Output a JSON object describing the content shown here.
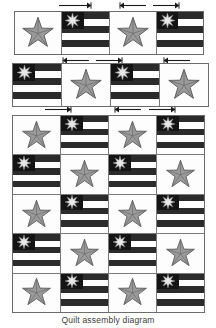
{
  "caption": "Quilt assembly diagram",
  "colors": {
    "stripe_dark": "#2b2b2b",
    "stripe_light": "#ffffff",
    "canton": "#141414",
    "star_fill": "#9a9a9a",
    "star_outline": "#5a5a5a",
    "canton_star_fill": "#e8e8e8",
    "block_border": "#6b6b6b",
    "background": "#ffffff",
    "caption_color": "#3a3a3a",
    "arrow_color": "#1a1a1a"
  },
  "arrow_rows": [
    {
      "name": "arrow-row-top",
      "arrows": [
        {
          "direction": "right",
          "left": 58,
          "width": 34
        },
        {
          "direction": "left",
          "left": 119,
          "width": 28
        },
        {
          "direction": "right",
          "left": 152,
          "width": 28
        }
      ]
    },
    {
      "name": "arrow-row-between-strip1-strip2",
      "arrows": [
        {
          "direction": "left",
          "left": 62,
          "width": 28
        },
        {
          "direction": "right",
          "left": 95,
          "width": 28
        },
        {
          "direction": "left",
          "left": 163,
          "width": 28
        }
      ]
    },
    {
      "name": "arrow-row-between-strip2-body",
      "arrows": [
        {
          "direction": "right",
          "left": 44,
          "width": 28
        },
        {
          "direction": "left",
          "left": 114,
          "width": 28
        },
        {
          "direction": "right",
          "left": 148,
          "width": 28
        }
      ]
    }
  ],
  "strips": [
    {
      "name": "block-strip-row-1",
      "top": 11,
      "left": 14,
      "width": 190,
      "height": 44,
      "cells": [
        {
          "type": "star",
          "star": "five-point"
        },
        {
          "type": "flag",
          "star": "eight-point",
          "stripe_pattern": [
            "d",
            "l",
            "d",
            "l",
            "d",
            "l"
          ]
        },
        {
          "type": "star",
          "star": "five-point"
        },
        {
          "type": "flag",
          "star": "eight-point",
          "stripe_pattern": [
            "d",
            "l",
            "d",
            "l",
            "d",
            "l"
          ]
        }
      ]
    },
    {
      "name": "block-strip-row-2",
      "top": 63,
      "left": 12,
      "width": 197,
      "height": 44,
      "cells": [
        {
          "type": "flag",
          "star": "eight-point",
          "stripe_pattern": [
            "d",
            "l",
            "d",
            "l",
            "d",
            "l"
          ]
        },
        {
          "type": "star",
          "star": "five-point"
        },
        {
          "type": "flag",
          "star": "eight-point",
          "stripe_pattern": [
            "d",
            "l",
            "d",
            "l",
            "d",
            "l"
          ]
        },
        {
          "type": "star",
          "star": "five-point"
        }
      ]
    }
  ],
  "quilt_body": {
    "name": "quilt-body-grid",
    "top": 115,
    "left": 12,
    "width": 193,
    "height": 198,
    "rows": [
      {
        "name": "quilt-row-1",
        "cells": [
          {
            "type": "star",
            "star": "five-point"
          },
          {
            "type": "flag",
            "star": "eight-point",
            "stripe_pattern": [
              "d",
              "l",
              "d",
              "l",
              "d",
              "l"
            ]
          },
          {
            "type": "star",
            "star": "five-point"
          },
          {
            "type": "flag",
            "star": "eight-point",
            "stripe_pattern": [
              "d",
              "l",
              "d",
              "l",
              "d",
              "l"
            ]
          }
        ]
      },
      {
        "name": "quilt-row-2",
        "cells": [
          {
            "type": "flag",
            "star": "eight-point",
            "stripe_pattern": [
              "d",
              "l",
              "d",
              "l",
              "d",
              "l"
            ]
          },
          {
            "type": "star",
            "star": "five-point"
          },
          {
            "type": "flag",
            "star": "eight-point",
            "stripe_pattern": [
              "d",
              "l",
              "d",
              "l",
              "d",
              "l"
            ]
          },
          {
            "type": "star",
            "star": "five-point"
          }
        ]
      },
      {
        "name": "quilt-row-3",
        "cells": [
          {
            "type": "star",
            "star": "five-point"
          },
          {
            "type": "flag",
            "star": "eight-point",
            "stripe_pattern": [
              "d",
              "l",
              "d",
              "l",
              "d",
              "l"
            ]
          },
          {
            "type": "star",
            "star": "five-point"
          },
          {
            "type": "flag",
            "star": "eight-point",
            "stripe_pattern": [
              "d",
              "l",
              "d",
              "l",
              "d",
              "l"
            ]
          }
        ]
      },
      {
        "name": "quilt-row-4",
        "cells": [
          {
            "type": "flag",
            "star": "eight-point",
            "stripe_pattern": [
              "d",
              "l",
              "d",
              "l",
              "d",
              "l"
            ]
          },
          {
            "type": "star",
            "star": "five-point"
          },
          {
            "type": "flag",
            "star": "eight-point",
            "stripe_pattern": [
              "d",
              "l",
              "d",
              "l",
              "d",
              "l"
            ]
          },
          {
            "type": "star",
            "star": "five-point"
          }
        ]
      },
      {
        "name": "quilt-row-5",
        "cells": [
          {
            "type": "star",
            "star": "five-point"
          },
          {
            "type": "flag",
            "star": "eight-point",
            "stripe_pattern": [
              "d",
              "l",
              "d",
              "l",
              "d",
              "l"
            ]
          },
          {
            "type": "star",
            "star": "five-point"
          },
          {
            "type": "flag",
            "star": "eight-point",
            "stripe_pattern": [
              "d",
              "l",
              "d",
              "l",
              "d",
              "l"
            ]
          }
        ]
      }
    ]
  },
  "caption_position": {
    "top": 315
  }
}
